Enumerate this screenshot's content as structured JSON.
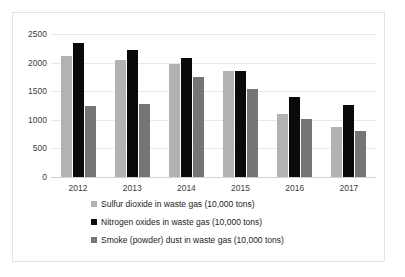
{
  "chart_data": {
    "type": "bar",
    "title": "",
    "subtitle": "",
    "xlabel": "",
    "ylabel": "",
    "categories": [
      "2012",
      "2013",
      "2014",
      "2015",
      "2016",
      "2017"
    ],
    "series": [
      {
        "name": "Sulfur dioxide in waste gas (10,000 tons)",
        "color": "#b2b2b2",
        "values": [
          2118,
          2044,
          1974,
          1859,
          1102,
          875
        ]
      },
      {
        "name": "Nitrogen oxides in waste gas (10,000 tons)",
        "color": "#0a0a0a",
        "values": [
          2338,
          2227,
          2078,
          1851,
          1394,
          1259
        ]
      },
      {
        "name": "Smoke (powder) dust in waste gas (10,000 tons)",
        "color": "#757575",
        "values": [
          1235,
          1278,
          1741,
          1538,
          1011,
          796
        ]
      }
    ],
    "ylim": [
      0,
      2500
    ],
    "y_ticks": [
      0,
      500,
      1000,
      1500,
      2000,
      2500
    ],
    "y_tick_labels": [
      "0",
      "500",
      "1000",
      "1500",
      "2000",
      "2500"
    ],
    "grid": true,
    "legend_position": "bottom"
  }
}
